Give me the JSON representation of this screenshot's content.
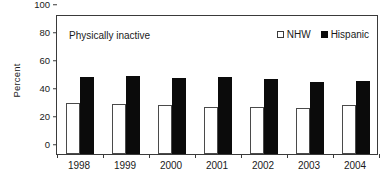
{
  "chart_data": {
    "type": "bar",
    "title": "",
    "annotation": "Physically inactive",
    "xlabel": "",
    "ylabel": "Percent",
    "ylim": [
      0,
      100
    ],
    "yticks": [
      0,
      20,
      40,
      60,
      80,
      100
    ],
    "grid": false,
    "legend_position": "top-right",
    "categories": [
      "1998",
      "1999",
      "2000",
      "2001",
      "2002",
      "2003",
      "2004"
    ],
    "series": [
      {
        "name": "NHW",
        "marker": "open-square",
        "color": "#ffffff",
        "edge_color": "#4a4a4a",
        "values": [
          36.5,
          36.0,
          35.0,
          33.3,
          33.7,
          33.0,
          35.0
        ]
      },
      {
        "name": "Hispanic",
        "marker": "filled-square",
        "color": "#0b0b0b",
        "edge_color": "#0b0b0b",
        "values": [
          55.3,
          56.0,
          54.3,
          55.3,
          53.7,
          51.5,
          52.4
        ]
      }
    ]
  },
  "legend": {
    "items": [
      {
        "label": "NHW",
        "swatch": "open-square"
      },
      {
        "label": "Hispanic",
        "swatch": "filled-square"
      }
    ]
  }
}
